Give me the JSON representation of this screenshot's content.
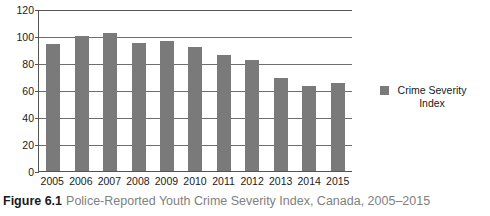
{
  "caption": {
    "figure_number": "Figure 6.1",
    "text": "Police-Reported Youth Crime Severity Index, Canada, 2005–2015"
  },
  "legend": {
    "label": "Crime Severity Index",
    "swatch_color": "#7a7a7a",
    "position": "right"
  },
  "chart_data": {
    "type": "bar",
    "title": "Police-Reported Youth Crime Severity Index, Canada, 2005–2015",
    "xlabel": "",
    "ylabel": "",
    "categories": [
      "2005",
      "2006",
      "2007",
      "2008",
      "2009",
      "2010",
      "2011",
      "2012",
      "2013",
      "2014",
      "2015"
    ],
    "values": [
      94,
      100,
      102,
      95,
      96,
      92,
      86,
      82,
      69,
      63,
      65
    ],
    "series": [
      {
        "name": "Crime Severity Index",
        "color": "#7a7a7a",
        "values": [
          94,
          100,
          102,
          95,
          96,
          92,
          86,
          82,
          69,
          63,
          65
        ]
      }
    ],
    "ylim": [
      0,
      120
    ],
    "yticks": [
      0,
      20,
      40,
      60,
      80,
      100,
      120
    ],
    "ytick_labels": [
      "0",
      "20",
      "40",
      "60",
      "80",
      "100",
      "120"
    ],
    "grid": true,
    "grid_axis": "y",
    "legend_position": "right",
    "bar_color": "#7a7a7a",
    "axis_color": "#555555"
  }
}
